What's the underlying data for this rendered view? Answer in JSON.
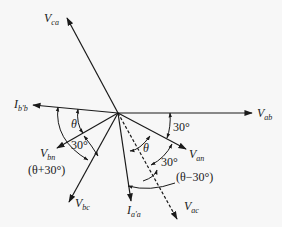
{
  "diagram": {
    "type": "phasor-diagram",
    "origin": [
      118,
      113
    ],
    "phasors": [
      {
        "name": "V_ca",
        "main": "V",
        "sub": "ca",
        "tip": [
          67,
          18
        ],
        "style": "solid",
        "label_pos": [
          44,
          22
        ]
      },
      {
        "name": "I_b'b",
        "main": "I",
        "sub": "b'b",
        "tip": [
          33,
          105
        ],
        "style": "solid",
        "label_pos": [
          14,
          108
        ]
      },
      {
        "name": "V_ab",
        "main": "V",
        "sub": "ab",
        "tip": [
          252,
          113
        ],
        "style": "solid",
        "label_pos": [
          257,
          117
        ]
      },
      {
        "name": "V_bn",
        "main": "V",
        "sub": "bn",
        "tip": [
          57,
          148
        ],
        "style": "solid",
        "label_pos": [
          40,
          157
        ]
      },
      {
        "name": "V_an",
        "main": "V",
        "sub": "an",
        "tip": [
          186,
          149
        ],
        "style": "solid",
        "label_pos": [
          189,
          158
        ]
      },
      {
        "name": "V_bc",
        "main": "V",
        "sub": "bc",
        "tip": [
          69,
          202
        ],
        "style": "solid",
        "label_pos": [
          75,
          207
        ]
      },
      {
        "name": "I_a'a",
        "main": "I",
        "sub": "a'a",
        "tip": [
          131,
          201
        ],
        "style": "solid",
        "label_pos": [
          127,
          214
        ]
      },
      {
        "name": "V_ac",
        "main": "V",
        "sub": "ac",
        "tip": [
          177,
          219
        ],
        "style": "dashed",
        "label_pos": [
          184,
          210
        ]
      }
    ],
    "angle_labels": [
      {
        "text": "θ",
        "pos": [
          71,
          128
        ],
        "italic": true
      },
      {
        "text": "30°",
        "pos": [
          71,
          149
        ],
        "italic": false
      },
      {
        "text": "(θ+30°)",
        "pos": [
          28,
          174
        ],
        "italic": false
      },
      {
        "text": "30°",
        "pos": [
          173,
          131
        ],
        "italic": false
      },
      {
        "text": "θ",
        "pos": [
          143,
          152
        ],
        "italic": true
      },
      {
        "text": "30°",
        "pos": [
          161,
          166
        ],
        "italic": false
      },
      {
        "text": "(θ−30°)",
        "pos": [
          176,
          181
        ],
        "italic": false
      }
    ]
  }
}
